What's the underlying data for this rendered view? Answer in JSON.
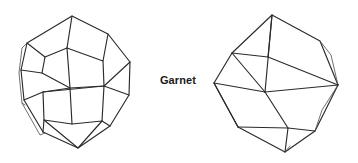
{
  "figure": {
    "caption": "Garnet",
    "background_color": "#ffffff",
    "line_color": "#2b2b2b",
    "text_color": "#1a1a1a",
    "shapes": [
      {
        "name": "trapezohedron",
        "label": "Garnet trapezohedron crystal form",
        "position": "left"
      },
      {
        "name": "rhombic-dodecahedron",
        "label": "Garnet rhombic dodecahedron crystal form",
        "position": "right"
      }
    ]
  }
}
